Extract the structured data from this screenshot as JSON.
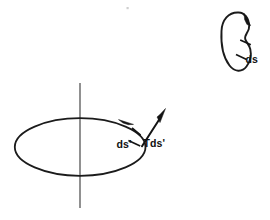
{
  "figure": {
    "background_color": "#ffffff",
    "ink_color": "#1b1b1b",
    "axis_color": "#555555",
    "labels": {
      "small_loop_arc": "ds",
      "large_loop_arc": "ds'",
      "tangent_vector": "Tds'"
    },
    "small_loop": {
      "name": "small-closed-curve",
      "center_x": 237,
      "center_y": 41,
      "radius_x": 15,
      "radius_y": 29,
      "orientation": "clockwise",
      "arrowhead_at": "top-right"
    },
    "large_loop": {
      "name": "large-ellipse-curve",
      "center_x": 80,
      "center_y": 147,
      "radius_x": 65,
      "radius_y": 29,
      "orientation": "clockwise",
      "arrowhead_at": "upper-right"
    },
    "axis_line": {
      "name": "vertical-axis",
      "x": 80,
      "y_top": 83,
      "y_bottom": 208
    }
  }
}
